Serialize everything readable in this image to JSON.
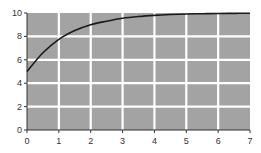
{
  "chart_data": {
    "type": "line",
    "title": "",
    "xlabel": "",
    "ylabel": "",
    "xlim": [
      0,
      7
    ],
    "ylim": [
      0,
      10
    ],
    "x_ticks": [
      "0",
      "1",
      "2",
      "3",
      "4",
      "5",
      "6",
      "7"
    ],
    "y_ticks": [
      "0",
      "2",
      "4",
      "6",
      "8",
      "10"
    ],
    "grid": true,
    "legend": null,
    "series": [
      {
        "name": "curve",
        "x": [
          0,
          0.5,
          1,
          1.5,
          2,
          2.5,
          3,
          3.5,
          4,
          4.5,
          5,
          5.5,
          6,
          6.5,
          7
        ],
        "values": [
          5.0,
          6.6,
          7.75,
          8.5,
          9.0,
          9.3,
          9.55,
          9.7,
          9.8,
          9.87,
          9.92,
          9.94,
          9.96,
          9.97,
          9.98
        ]
      }
    ],
    "colors": {
      "plot_background": "#a3a3a3",
      "grid": "#ffffff",
      "line": "#1a1a1a",
      "axis": "#333333"
    }
  }
}
